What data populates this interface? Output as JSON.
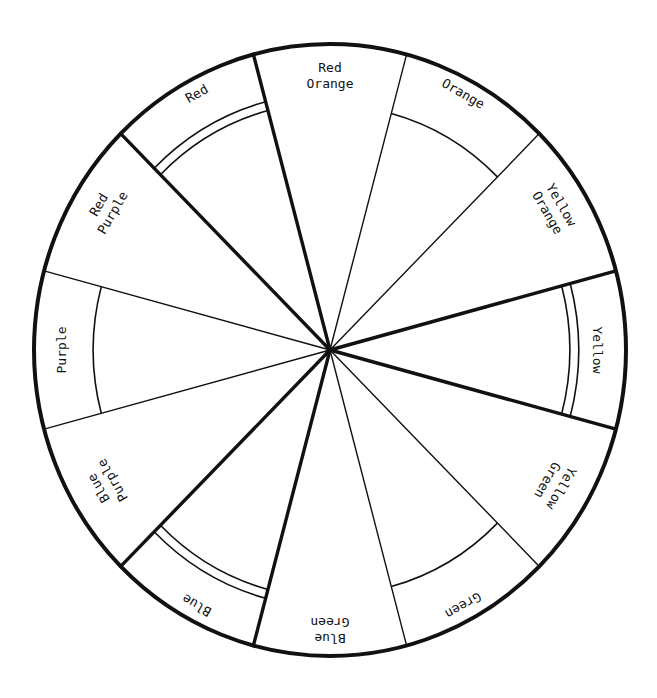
{
  "diagram": {
    "type": "color-wheel",
    "center": {
      "x": 330,
      "y": 350
    },
    "radius": {
      "rx": 296,
      "ry": 306
    },
    "stroke_color": "#111111",
    "background_color": "#ffffff",
    "sectors": [
      {
        "id": "yellow",
        "lines": [
          "Yellow"
        ],
        "center_angle": 0,
        "kind": "primary"
      },
      {
        "id": "yellow-orange",
        "lines": [
          "Yellow",
          "Orange"
        ],
        "center_angle": 30,
        "kind": "tertiary"
      },
      {
        "id": "orange",
        "lines": [
          "Orange"
        ],
        "center_angle": 60,
        "kind": "secondary"
      },
      {
        "id": "red-orange",
        "lines": [
          "Red",
          "Orange"
        ],
        "center_angle": 90,
        "kind": "tertiary"
      },
      {
        "id": "red",
        "lines": [
          "Red"
        ],
        "center_angle": 120,
        "kind": "primary"
      },
      {
        "id": "red-purple",
        "lines": [
          "Red",
          "Purple"
        ],
        "center_angle": 150,
        "kind": "tertiary"
      },
      {
        "id": "purple",
        "lines": [
          "Purple"
        ],
        "center_angle": 180,
        "kind": "secondary"
      },
      {
        "id": "blue-purple",
        "lines": [
          "Blue",
          "Purple"
        ],
        "center_angle": 210,
        "kind": "tertiary"
      },
      {
        "id": "blue",
        "lines": [
          "Blue"
        ],
        "center_angle": 240,
        "kind": "primary"
      },
      {
        "id": "blue-green",
        "lines": [
          "Blue",
          "Green"
        ],
        "center_angle": 270,
        "kind": "tertiary"
      },
      {
        "id": "green",
        "lines": [
          "Green"
        ],
        "center_angle": 300,
        "kind": "secondary"
      },
      {
        "id": "yellow-green",
        "lines": [
          "Yellow",
          "Green"
        ],
        "center_angle": 330,
        "kind": "tertiary"
      }
    ],
    "labels": {
      "yellow": "Yellow",
      "yellow_orange_1": "Yellow",
      "yellow_orange_2": "Orange",
      "orange": "Orange",
      "red_orange_1": "Red",
      "red_orange_2": "Orange",
      "red": "Red",
      "red_purple_1": "Red",
      "red_purple_2": "Purple",
      "purple": "Purple",
      "blue_purple_1": "Blue",
      "blue_purple_2": "Purple",
      "blue": "Blue",
      "blue_green_1": "Blue",
      "blue_green_2": "Green",
      "green": "Green",
      "yellow_green_1": "Yellow",
      "yellow_green_2": "Green"
    }
  }
}
